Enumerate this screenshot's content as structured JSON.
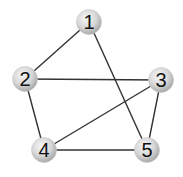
{
  "graph": {
    "nodes": [
      {
        "id": "1",
        "label": "1",
        "x": 89,
        "y": 22
      },
      {
        "id": "2",
        "label": "2",
        "x": 25,
        "y": 79
      },
      {
        "id": "3",
        "label": "3",
        "x": 161,
        "y": 80
      },
      {
        "id": "4",
        "label": "4",
        "x": 44,
        "y": 150
      },
      {
        "id": "5",
        "label": "5",
        "x": 147,
        "y": 150
      }
    ],
    "edges": [
      [
        "1",
        "2"
      ],
      [
        "1",
        "5"
      ],
      [
        "2",
        "3"
      ],
      [
        "2",
        "4"
      ],
      [
        "3",
        "4"
      ],
      [
        "3",
        "5"
      ],
      [
        "4",
        "5"
      ]
    ],
    "colors": {
      "edge": "#333333",
      "node_fill_light": "#f4f4f4",
      "node_fill_dark": "#b8b8b8",
      "label": "#111111"
    }
  }
}
